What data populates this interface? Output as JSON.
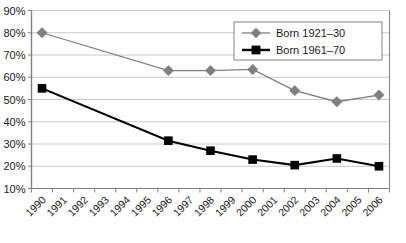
{
  "chart_data": {
    "type": "line",
    "title": "",
    "xlabel": "",
    "ylabel": "",
    "grid": true,
    "legend_position": "top-right",
    "ylim": [
      10,
      90
    ],
    "ytick_labels": [
      "90%",
      "80%",
      "70%",
      "60%",
      "50%",
      "40%",
      "30%",
      "20%",
      "10%"
    ],
    "ytick_values": [
      90,
      80,
      70,
      60,
      50,
      40,
      30,
      20,
      10
    ],
    "categories": [
      "1990",
      "1991",
      "1992",
      "1993",
      "1994",
      "1995",
      "1996",
      "1997",
      "1998",
      "1999",
      "2000",
      "2001",
      "2002",
      "2003",
      "2004",
      "2005",
      "2006"
    ],
    "series": [
      {
        "name": "Born 1921-30",
        "marker": "diamond",
        "color": "#7f7f7f",
        "points": [
          {
            "x": "1990",
            "y": 80
          },
          {
            "x": "1996",
            "y": 63
          },
          {
            "x": "1998",
            "y": 63
          },
          {
            "x": "2000",
            "y": 63.5
          },
          {
            "x": "2002",
            "y": 54
          },
          {
            "x": "2004",
            "y": 49
          },
          {
            "x": "2006",
            "y": 52
          }
        ]
      },
      {
        "name": "Born 1961-70",
        "marker": "square",
        "color": "#000000",
        "points": [
          {
            "x": "1990",
            "y": 55
          },
          {
            "x": "1996",
            "y": 31.5
          },
          {
            "x": "1998",
            "y": 27
          },
          {
            "x": "2000",
            "y": 23
          },
          {
            "x": "2002",
            "y": 20.5
          },
          {
            "x": "2004",
            "y": 23.5
          },
          {
            "x": "2006",
            "y": 20
          }
        ]
      }
    ]
  },
  "legend": {
    "entries": [
      {
        "label": "Born 1921–30"
      },
      {
        "label": "Born 1961–70"
      }
    ]
  },
  "colors": {
    "series_1": "#7f7f7f",
    "series_2": "#000000",
    "grid": "#c8c8c8",
    "axis": "#808080",
    "plot_background": "#ffffff",
    "legend_border": "#808080"
  }
}
